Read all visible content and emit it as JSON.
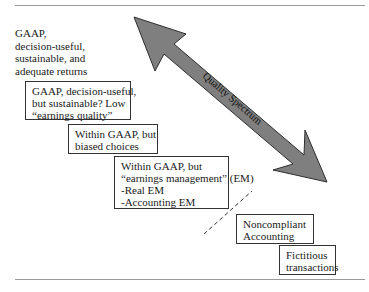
{
  "diagram": {
    "spectrum_label": "Quality Spectrum",
    "top_label": {
      "lines": [
        "GAAP,",
        "decision-useful,",
        "sustainable, and",
        "adequate returns"
      ]
    },
    "boxes": [
      {
        "id": "low-earnings-quality",
        "lines": [
          "GAAP, decision-useful,",
          "but sustainable? Low",
          "“earnings quality”"
        ]
      },
      {
        "id": "biased-choices",
        "lines": [
          "Within GAAP, but",
          "biased choices"
        ]
      },
      {
        "id": "earnings-management",
        "lines": [
          "Within GAAP, but",
          "“earnings management” (EM)",
          "-Real EM",
          "-Accounting EM"
        ]
      },
      {
        "id": "noncompliant-accounting",
        "lines": [
          "Noncompliant",
          "Accounting"
        ]
      },
      {
        "id": "fictitious-transactions",
        "lines": [
          "Fictitious",
          "transactions"
        ]
      }
    ],
    "colors": {
      "arrow_fill": "#7f7f7f",
      "arrow_stroke": "#2e2e2e",
      "box_border": "#333333",
      "rule": "#9a9a9a"
    }
  }
}
